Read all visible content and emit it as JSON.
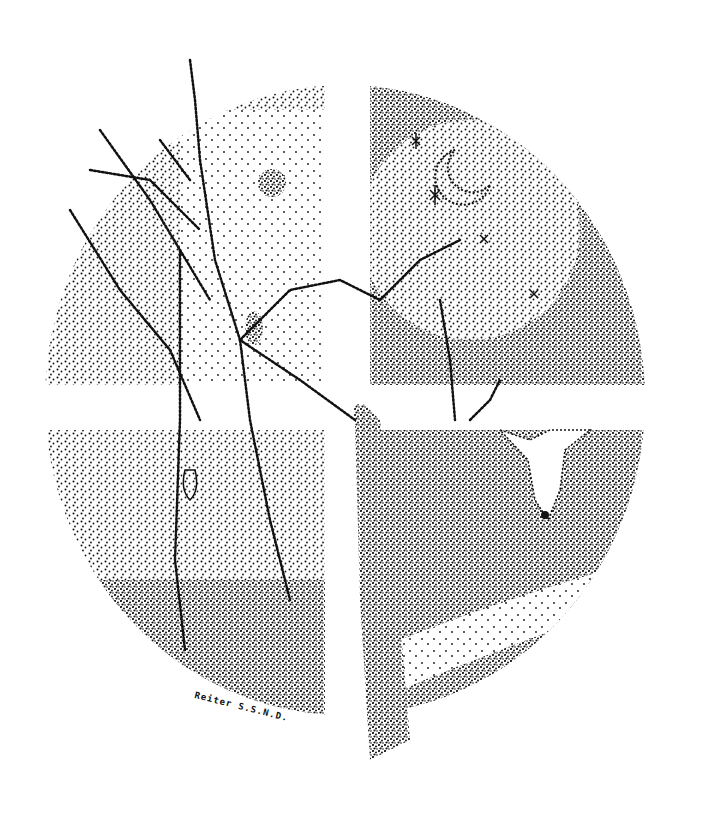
{
  "artwork": {
    "style": "stipple pen-and-ink illustration",
    "subject": "circular medallion divided by a white cross into four seasonal quadrants, with a bare tree crossing all quadrants",
    "colors": {
      "ink": "#111111",
      "paper": "#ffffff"
    },
    "quadrants": [
      {
        "position": "upper-left",
        "content": "sun among bare branches, cocoon hanging"
      },
      {
        "position": "upper-right",
        "content": "night sky with stars and crescent moon"
      },
      {
        "position": "lower-left",
        "content": "ground with small plant/flower at trunk base"
      },
      {
        "position": "lower-right",
        "content": "deer head among trees, stream below"
      }
    ],
    "signature": "Reiter S.S.N.D."
  }
}
